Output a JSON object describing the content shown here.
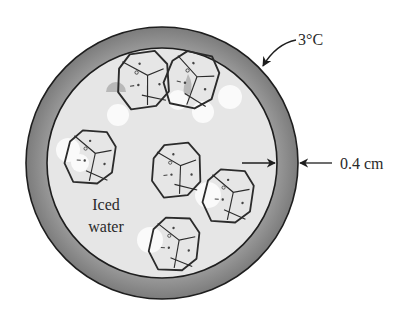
{
  "diagram": {
    "labels": {
      "surface_temperature": "3°C",
      "wall_thickness": "0.4 cm",
      "contents_line1": "Iced",
      "contents_line2": "water"
    },
    "colors": {
      "wall": "#8c8c8c",
      "wall_edge": "#1e1e1e",
      "interior": "#e6e6e6",
      "ice_stroke": "#2b2b2b",
      "bubble": "#fafafa",
      "text": "#2a2a2a"
    },
    "geometry": {
      "center": [
        162,
        163
      ],
      "outer_radius": 136,
      "inner_radius": 115
    },
    "ice_cubes": [
      {
        "name": "ice-cube-top-left",
        "x": 148,
        "y": 78
      },
      {
        "name": "ice-cube-top-right",
        "x": 198,
        "y": 80
      },
      {
        "name": "ice-cube-left",
        "x": 90,
        "y": 155
      },
      {
        "name": "ice-cube-center",
        "x": 175,
        "y": 172
      },
      {
        "name": "ice-cube-right",
        "x": 227,
        "y": 195
      },
      {
        "name": "ice-cube-bottom",
        "x": 175,
        "y": 245
      }
    ]
  }
}
